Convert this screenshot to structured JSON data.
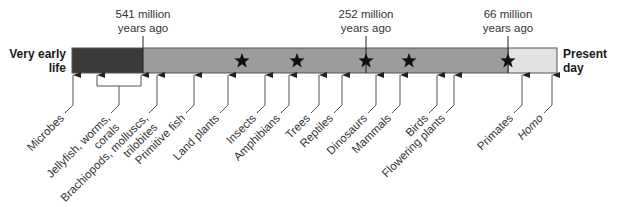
{
  "diagram": {
    "type": "timeline",
    "start_label": "Very early life",
    "end_label": "Present day",
    "start_label_lines": [
      "Very early",
      "life"
    ],
    "end_label_lines": [
      "Present",
      "day"
    ],
    "bar": {
      "x_start": 72,
      "x_end": 557,
      "y_top": 48,
      "y_bottom": 73,
      "segments": [
        {
          "name": "precambrian",
          "x_start": 72,
          "x_end": 143,
          "color": "#3a3a3a"
        },
        {
          "name": "phanerozoic-pre-66",
          "x_start": 143,
          "x_end": 509,
          "color": "#9c9c9c"
        },
        {
          "name": "cenozoic",
          "x_start": 509,
          "x_end": 557,
          "color": "#e2e2e2"
        }
      ]
    },
    "time_markers": [
      {
        "label_lines": [
          "541 million",
          "years ago"
        ],
        "x": 143
      },
      {
        "label_lines": [
          "252 million",
          "years ago"
        ],
        "x": 366
      },
      {
        "label_lines": [
          "66 million",
          "years ago"
        ],
        "x": 508
      }
    ],
    "stars": [
      {
        "x": 242
      },
      {
        "x": 297
      },
      {
        "x": 366
      },
      {
        "x": 409
      },
      {
        "x": 508
      }
    ],
    "events": [
      {
        "label_lines": [
          "Microbes"
        ],
        "x": 73,
        "italic": false
      },
      {
        "label_lines": [
          "Jellyfish, worms,",
          "corals"
        ],
        "x": 119,
        "bracket": [
          97,
          141
        ],
        "italic": false
      },
      {
        "label_lines": [
          "Brachiopods, molluscs,",
          "trilobites"
        ],
        "x": 157,
        "italic": false
      },
      {
        "label_lines": [
          "Primitive fish"
        ],
        "x": 194,
        "italic": false
      },
      {
        "label_lines": [
          "Land plants"
        ],
        "x": 228,
        "italic": false
      },
      {
        "label_lines": [
          "Insects"
        ],
        "x": 265,
        "italic": false
      },
      {
        "label_lines": [
          "Amphibians"
        ],
        "x": 289,
        "italic": false
      },
      {
        "label_lines": [
          "Trees"
        ],
        "x": 319,
        "italic": false
      },
      {
        "label_lines": [
          "Reptiles"
        ],
        "x": 342,
        "italic": false
      },
      {
        "label_lines": [
          "Dinosaurs"
        ],
        "x": 376,
        "italic": false
      },
      {
        "label_lines": [
          "Mammals"
        ],
        "x": 400,
        "italic": false
      },
      {
        "label_lines": [
          "Birds"
        ],
        "x": 437,
        "italic": false
      },
      {
        "label_lines": [
          "Flowering plants"
        ],
        "x": 454,
        "italic": false
      },
      {
        "label_lines": [
          "Primates"
        ],
        "x": 522,
        "italic": false
      },
      {
        "label_lines": [
          "Homo"
        ],
        "x": 552,
        "italic": true
      }
    ],
    "colors": {
      "text": "#333333",
      "line": "#555555",
      "star": "#111111",
      "bar_border": "#555555"
    }
  }
}
